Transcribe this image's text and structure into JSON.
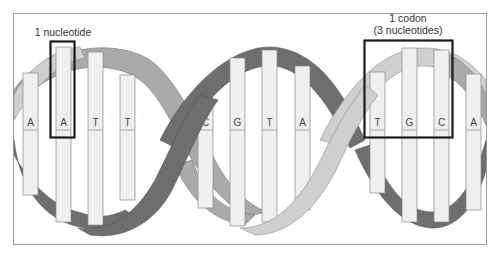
{
  "figure": {
    "colors": {
      "background": "#ffffff",
      "frame": "#9a9a9a",
      "strand_dark": "#6e6e6e",
      "strand_medium": "#a9a9a9",
      "strand_light": "#cfcfcf",
      "bar_fill": "#efefef",
      "bar_stroke": "#8a8a8a",
      "highlight_box": "#1a1a1a"
    },
    "annotations": {
      "nucleotide": {
        "label": "1 nucleotide"
      },
      "codon": {
        "line1": "1 codon",
        "line2": "(3 nucleotides)"
      }
    },
    "bases": [
      {
        "letter": "A",
        "x": 23,
        "top": 73,
        "bottom": 195
      },
      {
        "letter": "A",
        "x": 56,
        "top": 47,
        "bottom": 222
      },
      {
        "letter": "T",
        "x": 88,
        "top": 52,
        "bottom": 225
      },
      {
        "letter": "T",
        "x": 120,
        "top": 75,
        "bottom": 200
      },
      {
        "letter": "C",
        "x": 198,
        "top": 100,
        "bottom": 208
      },
      {
        "letter": "G",
        "x": 230,
        "top": 58,
        "bottom": 226
      },
      {
        "letter": "T",
        "x": 262,
        "top": 50,
        "bottom": 222
      },
      {
        "letter": "A",
        "x": 295,
        "top": 66,
        "bottom": 210
      },
      {
        "letter": "T",
        "x": 370,
        "top": 72,
        "bottom": 193
      },
      {
        "letter": "G",
        "x": 402,
        "top": 48,
        "bottom": 222
      },
      {
        "letter": "C",
        "x": 434,
        "top": 50,
        "bottom": 222
      },
      {
        "letter": "A",
        "x": 466,
        "top": 74,
        "bottom": 210
      }
    ]
  }
}
